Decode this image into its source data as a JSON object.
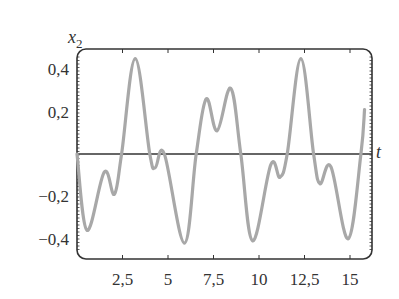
{
  "chart_data": {
    "type": "line",
    "title": "",
    "xlabel": "t",
    "ylabel": "x_2",
    "ylabel_main": "x",
    "ylabel_sub": "2",
    "xlim": [
      0,
      16.3
    ],
    "ylim": [
      -0.5,
      0.5
    ],
    "grid": false,
    "legend": null,
    "x_ticks": [
      2.5,
      5,
      7.5,
      10,
      12.5,
      15
    ],
    "x_tick_labels": [
      "2,5",
      "5",
      "7,5",
      "10",
      "12,5",
      "15"
    ],
    "y_ticks": [
      0.4,
      0.2,
      -0.2,
      -0.4
    ],
    "y_tick_labels": [
      "0,4",
      "0,2",
      "−0,2",
      "−0,4"
    ],
    "colors": {
      "curve": "#a8a8a8",
      "frame": "#333333",
      "zero_line": "#333333"
    },
    "series": [
      {
        "name": "x_2(t)",
        "x": [
          0,
          0.55,
          1.5,
          2.05,
          2.45,
          3.2,
          4.0,
          4.3,
          4.8,
          5.9,
          6.55,
          7.1,
          7.7,
          8.45,
          9.0,
          9.65,
          10.65,
          11.15,
          11.55,
          12.3,
          13.0,
          13.35,
          13.95,
          14.9,
          15.6,
          15.8
        ],
        "values": [
          0.0,
          -0.36,
          -0.085,
          -0.19,
          0.0,
          0.45,
          0.0,
          -0.065,
          0.0,
          -0.42,
          0.0,
          0.26,
          0.11,
          0.31,
          0.0,
          -0.41,
          -0.05,
          -0.11,
          0.0,
          0.45,
          0.0,
          -0.14,
          -0.06,
          -0.4,
          0.0,
          0.21
        ]
      }
    ]
  }
}
